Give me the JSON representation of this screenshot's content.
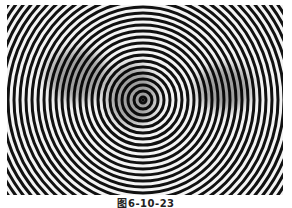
{
  "figure": {
    "center": {
      "x": 136,
      "y": 95
    },
    "ring_period_px": 6,
    "colors": {
      "dark": "#111111",
      "light": "#f4f4f4"
    }
  },
  "caption": "图6-10-23"
}
